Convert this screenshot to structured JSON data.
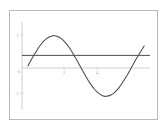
{
  "figure": {
    "frame_color": "#b9b9bd",
    "background_color": "#ffffff",
    "axis_color": "#c2c2c6",
    "curve_color": "#4a4a4e",
    "line_color": "#3a3a3e",
    "tick_label_color": "#9a9a9e"
  },
  "axis_labels": {
    "y_top": "1",
    "y_origin": "0",
    "y_bottom": "-1",
    "x_two": "2",
    "x_four": "4"
  },
  "chart_data": {
    "type": "line",
    "title": "",
    "subtitle": "",
    "xlabel": "",
    "ylabel": "",
    "xlim": [
      -0.35,
      7.35
    ],
    "ylim": [
      -1.45,
      1.45
    ],
    "grid": false,
    "legend": false,
    "legend_position": "none",
    "xticks": [
      2,
      4
    ],
    "xtick_labels": [
      "2",
      "4"
    ],
    "yticks": [
      -1,
      0,
      1
    ],
    "ytick_labels": [
      "-1",
      "0",
      "1"
    ],
    "annotations": [],
    "series": [
      {
        "name": "sin(x)",
        "kind": "curve",
        "color": "#4a4a4e",
        "x": [
          0,
          0.25,
          0.5,
          0.75,
          1,
          1.25,
          1.5,
          1.5708,
          1.75,
          2,
          2.25,
          2.5,
          2.75,
          3,
          3.1416,
          3.25,
          3.5,
          3.75,
          4,
          4.25,
          4.5,
          4.7124,
          5,
          5.25,
          5.5,
          5.75,
          6,
          6.25,
          6.2832,
          6.5,
          6.75,
          7
        ],
        "y": [
          0,
          0.247,
          0.479,
          0.682,
          0.841,
          0.949,
          0.997,
          1,
          0.984,
          0.909,
          0.778,
          0.599,
          0.382,
          0.141,
          0,
          -0.108,
          -0.351,
          -0.572,
          -0.757,
          -0.895,
          -0.978,
          -1,
          -0.959,
          -0.861,
          -0.706,
          -0.501,
          -0.279,
          -0.033,
          0,
          0.216,
          0.437,
          0.657
        ]
      },
      {
        "name": "y = 0.35",
        "kind": "horizontal-line",
        "color": "#3a3a3e",
        "value": 0.35,
        "x_start": -0.35,
        "x_end": 7.35
      }
    ]
  }
}
